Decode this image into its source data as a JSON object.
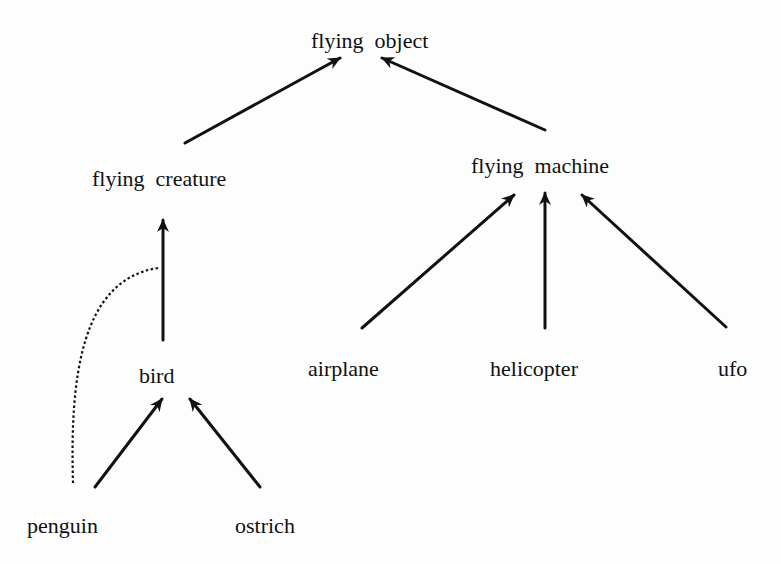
{
  "diagram": {
    "type": "is-a hierarchy",
    "nodes": {
      "flying_object": "flying  object",
      "flying_creature": "flying  creature",
      "flying_machine": "flying  machine",
      "bird": "bird",
      "airplane": "airplane",
      "helicopter": "helicopter",
      "ufo": "ufo",
      "penguin": "penguin",
      "ostrich": "ostrich"
    },
    "edges": [
      {
        "from": "flying creature",
        "to": "flying object",
        "style": "solid-arrow"
      },
      {
        "from": "flying machine",
        "to": "flying object",
        "style": "solid-arrow"
      },
      {
        "from": "bird",
        "to": "flying creature",
        "style": "solid-arrow"
      },
      {
        "from": "airplane",
        "to": "flying machine",
        "style": "solid-arrow"
      },
      {
        "from": "helicopter",
        "to": "flying machine",
        "style": "solid-arrow"
      },
      {
        "from": "ufo",
        "to": "flying machine",
        "style": "solid-arrow"
      },
      {
        "from": "penguin",
        "to": "bird",
        "style": "solid-arrow"
      },
      {
        "from": "ostrich",
        "to": "bird",
        "style": "solid-arrow"
      },
      {
        "from": "penguin",
        "to": "bird-to-flying-creature edge",
        "style": "dotted-cancel-link"
      }
    ],
    "colors": {
      "ink": "#111111",
      "background": "#fdfdfd"
    }
  }
}
